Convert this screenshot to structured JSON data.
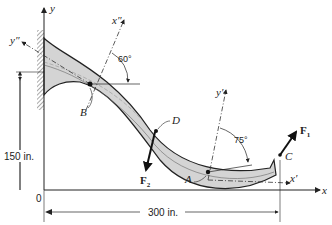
{
  "diagram": {
    "type": "curved beam force diagram",
    "axes": {
      "x": "x",
      "y": "y",
      "origin": "0",
      "x_prime": "x′",
      "y_prime": "y′",
      "x_double_prime": "x″",
      "y_double_prime": "y″"
    },
    "points": {
      "A": "A",
      "B": "B",
      "C": "C",
      "D": "D"
    },
    "forces": {
      "F1": {
        "label": "F",
        "sub": "1"
      },
      "F2": {
        "label": "F",
        "sub": "2"
      }
    },
    "angles": {
      "at_B": "60°",
      "at_A": "75°"
    },
    "dimensions": {
      "height": "150 in.",
      "width": "300 in."
    },
    "colors": {
      "beam_fill": "#d4d4d4",
      "line": "#222222"
    }
  }
}
